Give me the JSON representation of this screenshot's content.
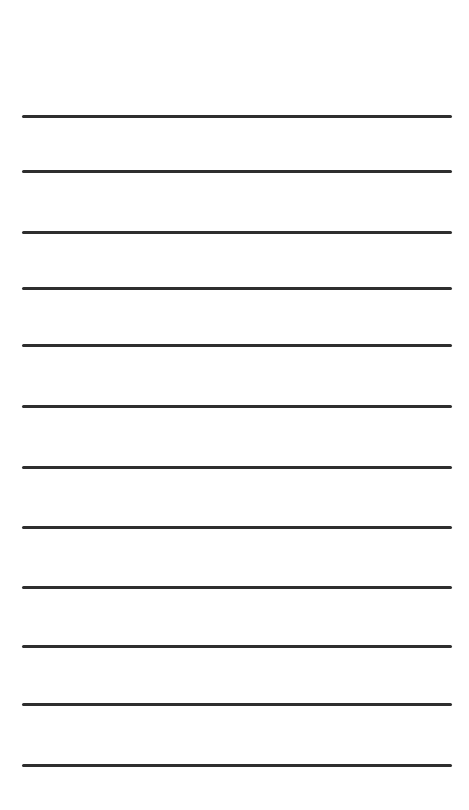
{
  "page": {
    "background": "#ffffff",
    "line_color": "#2e2e2e",
    "line_count": 12,
    "line_positions_y": [
      116,
      171,
      232,
      288,
      345,
      406,
      467,
      527,
      587,
      646,
      704,
      765
    ]
  }
}
